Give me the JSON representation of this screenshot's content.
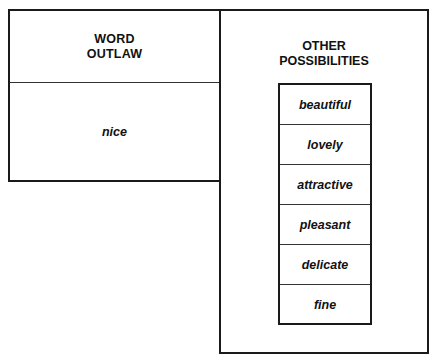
{
  "left_panel": {
    "header_line1": "WORD",
    "header_line2": "OUTLAW",
    "value": "nice"
  },
  "right_panel": {
    "header_line1": "OTHER",
    "header_line2": "POSSIBILITIES",
    "items": [
      "beautiful",
      "lovely",
      "attractive",
      "pleasant",
      "delicate",
      "fine"
    ]
  }
}
